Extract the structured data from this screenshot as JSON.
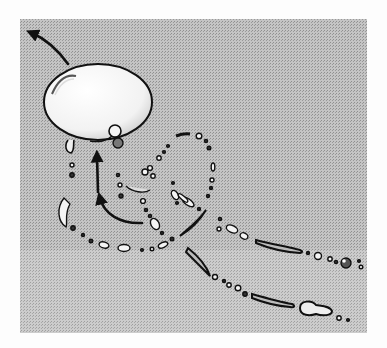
{
  "figure": {
    "background_color": "#fdfdfd",
    "panel": {
      "x": 20,
      "y": 19,
      "width": 347,
      "height": 314,
      "color": "#bdbdbd"
    },
    "main_drop": {
      "cx": 98,
      "cy": 100,
      "rx": 54,
      "ry": 42,
      "fill": "#fafafa",
      "stroke": "#111111"
    },
    "arrows": [
      {
        "name": "exit-arrow",
        "path": "M68 64 C 58 50, 48 40, 30 32"
      },
      {
        "name": "up-arrow",
        "path": "M98 190 L 97 152"
      },
      {
        "name": "curve-arrow",
        "path": "M142 223 C 120 224, 104 214, 101 197"
      }
    ],
    "ink_color": "#111111"
  }
}
